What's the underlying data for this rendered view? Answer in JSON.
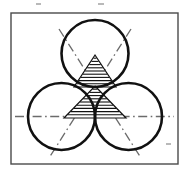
{
  "figure": {
    "background_color": "#ffffff",
    "frame": {
      "name": "drawing-border",
      "x": 11,
      "y": 13,
      "width": 167,
      "height": 151,
      "stroke": "#4a4a4a",
      "stroke_width": 1.4
    },
    "circles": [
      {
        "label": "top-circle",
        "cx": 95,
        "cy": 53.5,
        "r": 33.5,
        "stroke": "#111111",
        "stroke_width": 2.6
      },
      {
        "label": "left-circle",
        "cx": 61.5,
        "cy": 116.5,
        "r": 33.5,
        "stroke": "#111111",
        "stroke_width": 2.6
      },
      {
        "label": "right-circle",
        "cx": 128.5,
        "cy": 116.5,
        "r": 33.5,
        "stroke": "#111111",
        "stroke_width": 2.6
      }
    ],
    "hatched_regions": [
      {
        "label": "upper-hatched-triangle",
        "apex_x": 95,
        "apex_y": 55,
        "base_y": 87,
        "base_half_width": 21,
        "hatch_lines": 9,
        "hatch_color": "#111111",
        "outline_color": "#111111"
      },
      {
        "label": "lower-hatched-triangle",
        "apex_x": 95,
        "apex_y": 86,
        "base_y": 118,
        "base_half_width": 31,
        "hatch_lines": 9,
        "hatch_color": "#111111",
        "outline_color": "#111111"
      }
    ],
    "center_lines": [
      {
        "label": "horizontal-centerline",
        "x1": 15,
        "y1": 116.5,
        "x2": 174,
        "y2": 116.5,
        "style": "dash-dot",
        "color": "#6b6b6b",
        "stroke_width": 1.3
      },
      {
        "label": "left-diagonal-centerline",
        "x1": 131,
        "y1": 29,
        "x2": 49,
        "y2": 158,
        "style": "dash-dot",
        "color": "#6b6b6b",
        "stroke_width": 1.3
      },
      {
        "label": "right-diagonal-centerline",
        "x1": 59,
        "y1": 29,
        "x2": 141,
        "y2": 158,
        "style": "dash-dot",
        "color": "#6b6b6b",
        "stroke_width": 1.3
      }
    ],
    "specks": [
      {
        "label": "speck-top-left",
        "x": 36,
        "y": 3,
        "w": 5,
        "h": 2
      },
      {
        "label": "speck-top-mid",
        "x": 98,
        "y": 3,
        "w": 6,
        "h": 2
      },
      {
        "label": "speck-right-low",
        "x": 166,
        "y": 143,
        "w": 5,
        "h": 2
      }
    ]
  }
}
